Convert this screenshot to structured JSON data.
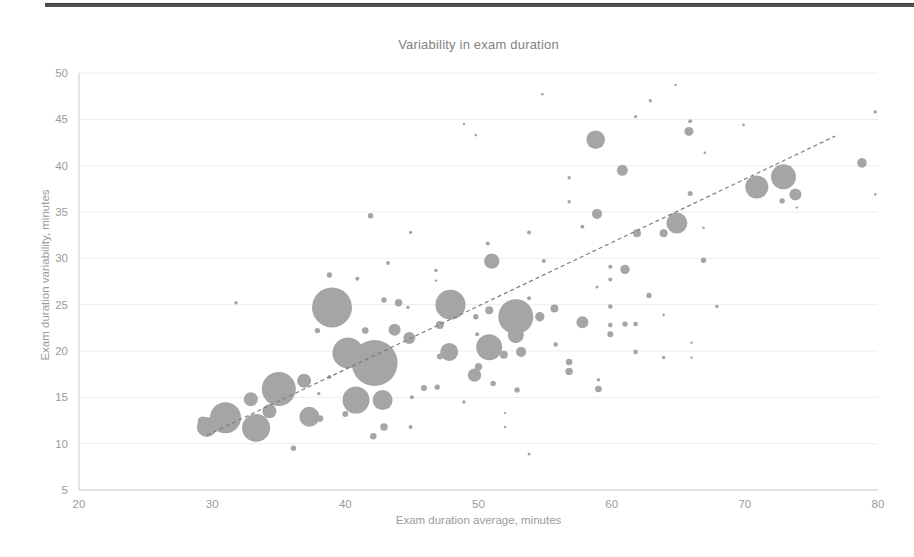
{
  "chart_data": {
    "type": "scatter",
    "title": "Variability in exam duration",
    "xlabel": "Exam duration average, minutes",
    "ylabel": "Exam duration variability, minutes",
    "xlim": [
      20,
      80
    ],
    "ylim": [
      5,
      50
    ],
    "x_ticks": [
      20,
      30,
      40,
      50,
      60,
      70,
      80
    ],
    "y_ticks": [
      5,
      10,
      15,
      20,
      25,
      30,
      35,
      40,
      45,
      50
    ],
    "grid": "horizontal, very faint",
    "legend": "none",
    "point_note": "points are [x_avg_minutes, y_variability_minutes, bubble_radius_px]",
    "points": [
      [
        42.2,
        18.7,
        23
      ],
      [
        39,
        24.7,
        20
      ],
      [
        52.8,
        23.7,
        17.5
      ],
      [
        35,
        15.9,
        17
      ],
      [
        40.2,
        19.8,
        15.5
      ],
      [
        31,
        12.8,
        15.5
      ],
      [
        47.9,
        25,
        15
      ],
      [
        33.3,
        11.7,
        14
      ],
      [
        40.8,
        14.7,
        13.5
      ],
      [
        50.8,
        20.4,
        13
      ],
      [
        72.9,
        38.8,
        12.5
      ],
      [
        70.9,
        37.7,
        11.5
      ],
      [
        64.9,
        33.8,
        10.5
      ],
      [
        29.6,
        11.8,
        10
      ],
      [
        42.8,
        14.7,
        10
      ],
      [
        37.3,
        12.9,
        10
      ],
      [
        58.8,
        42.8,
        9.3
      ],
      [
        47.8,
        19.9,
        9
      ],
      [
        52.8,
        21.7,
        8
      ],
      [
        51,
        29.7,
        7.7
      ],
      [
        34.3,
        13.5,
        7
      ],
      [
        36.9,
        16.8,
        7
      ],
      [
        32.9,
        14.8,
        7
      ],
      [
        49.7,
        17.4,
        6.7
      ],
      [
        57.8,
        23.1,
        6
      ],
      [
        73.8,
        36.9,
        6
      ],
      [
        43.7,
        22.3,
        6
      ],
      [
        44.8,
        21.4,
        6
      ],
      [
        60.8,
        39.5,
        5.5
      ],
      [
        53.2,
        19.9,
        5
      ],
      [
        29.3,
        12.4,
        5
      ],
      [
        58.9,
        34.8,
        5
      ],
      [
        78.8,
        40.3,
        4.8
      ],
      [
        61,
        28.8,
        4.7
      ],
      [
        54.6,
        23.7,
        4.7
      ],
      [
        65.8,
        43.7,
        4.5
      ],
      [
        47.1,
        22.8,
        4
      ],
      [
        50.8,
        24.4,
        4
      ],
      [
        55.7,
        24.6,
        4
      ],
      [
        51.9,
        19.6,
        4
      ],
      [
        61.9,
        32.7,
        4
      ],
      [
        63.9,
        32.7,
        4
      ],
      [
        42.9,
        11.8,
        3.8
      ],
      [
        50,
        18.3,
        3.7
      ],
      [
        44,
        25.2,
        3.7
      ],
      [
        56.8,
        17.8,
        3.7
      ],
      [
        38.1,
        12.7,
        3.3
      ],
      [
        42.1,
        10.8,
        3.3
      ],
      [
        56.8,
        18.8,
        3.3
      ],
      [
        59,
        15.9,
        3.3
      ],
      [
        41.5,
        22.2,
        3.3
      ],
      [
        40,
        13.2,
        3
      ],
      [
        47.1,
        19.4,
        3
      ],
      [
        45.9,
        16,
        3
      ],
      [
        59.9,
        21.8,
        3
      ],
      [
        38.8,
        28.2,
        2.7
      ],
      [
        42.9,
        25.5,
        2.7
      ],
      [
        37.9,
        22.2,
        2.7
      ],
      [
        49.8,
        23.7,
        2.7
      ],
      [
        52.9,
        15.8,
        2.7
      ],
      [
        51.1,
        16.5,
        2.7
      ],
      [
        46.9,
        16.1,
        2.7
      ],
      [
        36.1,
        9.5,
        2.7
      ],
      [
        61,
        22.9,
        2.7
      ],
      [
        66.9,
        29.8,
        2.7
      ],
      [
        41.9,
        34.6,
        2.7
      ],
      [
        72.8,
        36.2,
        2.7
      ],
      [
        62.8,
        26,
        2.7
      ],
      [
        65.9,
        37,
        2.5
      ],
      [
        59.9,
        24.8,
        2.3
      ],
      [
        59.9,
        22.8,
        2.3
      ],
      [
        61.8,
        22.9,
        2.3
      ],
      [
        61.8,
        19.9,
        2.3
      ],
      [
        55.8,
        20.7,
        2.3
      ],
      [
        40.9,
        27.8,
        2
      ],
      [
        43.2,
        29.5,
        2
      ],
      [
        49.9,
        21.8,
        2
      ],
      [
        53.8,
        25.7,
        2
      ],
      [
        38.8,
        17.2,
        2
      ],
      [
        45,
        15,
        2
      ],
      [
        44.9,
        11.8,
        2
      ],
      [
        65.9,
        44.8,
        2
      ],
      [
        57.8,
        33.4,
        2
      ],
      [
        54.9,
        29.7,
        2
      ],
      [
        50.7,
        31.6,
        2
      ],
      [
        53.8,
        32.8,
        2
      ],
      [
        59.9,
        29.1,
        2
      ],
      [
        59.9,
        27.7,
        2
      ],
      [
        56.8,
        36.1,
        1.7
      ],
      [
        56.8,
        38.7,
        1.7
      ],
      [
        44.7,
        24.7,
        1.7
      ],
      [
        46.8,
        28.7,
        1.7
      ],
      [
        31.8,
        25.2,
        1.7
      ],
      [
        48.9,
        14.5,
        1.7
      ],
      [
        38,
        15.4,
        1.7
      ],
      [
        59,
        16.9,
        1.7
      ],
      [
        63.9,
        19.3,
        1.7
      ],
      [
        67.9,
        24.8,
        1.7
      ],
      [
        44.9,
        32.8,
        1.7
      ],
      [
        62.9,
        47,
        1.7
      ],
      [
        61.8,
        45.3,
        1.7
      ],
      [
        79.8,
        45.8,
        1.7
      ],
      [
        58.9,
        26.9,
        1.5
      ],
      [
        53.8,
        8.9,
        1.5
      ],
      [
        63.9,
        23.9,
        1.3
      ],
      [
        66.9,
        33.3,
        1.3
      ],
      [
        67,
        41.4,
        1.3
      ],
      [
        48.9,
        44.5,
        1.3
      ],
      [
        49.8,
        43.3,
        1.3
      ],
      [
        54.8,
        47.7,
        1.3
      ],
      [
        64.8,
        48.7,
        1.3
      ],
      [
        69.9,
        44.4,
        1.3
      ],
      [
        79.8,
        36.9,
        1.3
      ],
      [
        52,
        11.8,
        1.3
      ],
      [
        52,
        13.3,
        1.2
      ],
      [
        46.8,
        27.6,
        1.2
      ],
      [
        66,
        20.9,
        1.2
      ],
      [
        66,
        19.3,
        1.2
      ],
      [
        73.9,
        35.5,
        1.2
      ]
    ],
    "trendline": {
      "style": "dashed",
      "x1": 29.6,
      "y1": 10.9,
      "x2": 76.8,
      "y2": 43.2
    }
  },
  "colors": {
    "bubble": "#a5a5a5",
    "trendline": "#7d7d7d",
    "axis_line": "#c9c9c9",
    "grid_line": "#efece8",
    "tick_text": "#9b9b9b",
    "title_text": "#828282",
    "page_top_rule": "#525252"
  }
}
